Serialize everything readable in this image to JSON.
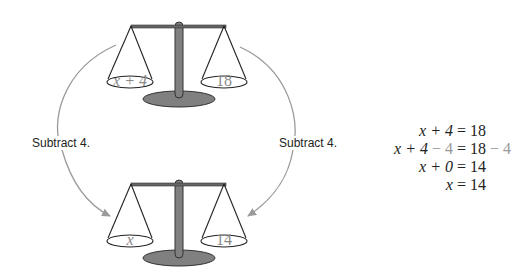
{
  "colors": {
    "ink": "#222222",
    "arrow": "#9a9a9a",
    "scale_body": "#808080",
    "pan_text": "#8a8a8a",
    "highlight": "#999999"
  },
  "top_scale": {
    "left_pan": "x + 4",
    "right_pan": "18"
  },
  "bottom_scale": {
    "left_pan": "x",
    "right_pan": "14"
  },
  "arrows": {
    "left_label": "Subtract 4.",
    "right_label": "Subtract 4."
  },
  "equations": [
    {
      "lhs": "x + 4",
      "lhs_extra": "",
      "rhs": "18",
      "rhs_extra": ""
    },
    {
      "lhs": "x + 4",
      "lhs_extra": " − 4",
      "rhs": "18",
      "rhs_extra": " − 4"
    },
    {
      "lhs": "x + 0",
      "lhs_extra": "",
      "rhs": "14",
      "rhs_extra": ""
    },
    {
      "lhs": "x",
      "lhs_extra": "",
      "rhs": "14",
      "rhs_extra": ""
    }
  ]
}
